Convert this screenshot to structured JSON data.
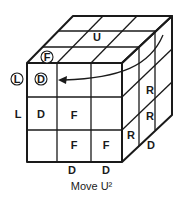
{
  "caption": "Move U²",
  "faces": {
    "up": {
      "label": "U"
    },
    "right": {
      "labels": [
        "R",
        "R",
        "R"
      ]
    },
    "front": {
      "labels": [
        "D",
        "F",
        "F",
        "F"
      ]
    },
    "left_side": {
      "label": "L"
    },
    "down": {
      "labels": [
        "D",
        "D",
        "D"
      ]
    }
  },
  "circled": {
    "front_marker": "F",
    "left_marker": "L",
    "down_marker": "D"
  },
  "arrow": {
    "direction": "right-to-left",
    "meaning": "U² rotation of top layer"
  },
  "colors": {
    "line": "#1a1a1a",
    "background": "#ffffff"
  }
}
